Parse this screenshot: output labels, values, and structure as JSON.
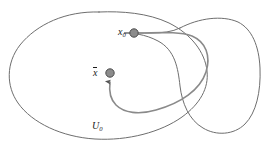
{
  "figure": {
    "type": "mathematical-diagram",
    "background_color": "#ffffff",
    "labels": {
      "point_x0": "x",
      "point_x0_subscript": "0",
      "point_xbar": "x",
      "region_u0": "U",
      "region_u0_subscript": "0"
    },
    "points": [
      {
        "name": "x0",
        "label": "x₀",
        "x": 134,
        "y": 33,
        "radius": 4.2,
        "fill": "#8c8c8c",
        "stroke": "#4d4d4d"
      },
      {
        "name": "xbar",
        "label": "x̄",
        "x": 110,
        "y": 73,
        "radius": 4.2,
        "fill": "#8c8c8c",
        "stroke": "#4d4d4d"
      }
    ],
    "curves": [
      {
        "name": "region-u0-outline",
        "stroke": "#6e6e6e",
        "stroke_width": 1.0,
        "closed": true
      },
      {
        "name": "region-right-outline",
        "stroke": "#6e6e6e",
        "stroke_width": 1.0,
        "closed": true
      },
      {
        "name": "connecting-path",
        "stroke": "#8a8a8a",
        "stroke_width": 1.6,
        "closed": false,
        "arrowhead": true,
        "arrow_target": "xbar"
      }
    ],
    "colors": {
      "outline": "#6e6e6e",
      "path": "#8a8a8a",
      "point_fill": "#8c8c8c",
      "point_stroke": "#4d4d4d",
      "text": "#1a1a1a"
    }
  }
}
